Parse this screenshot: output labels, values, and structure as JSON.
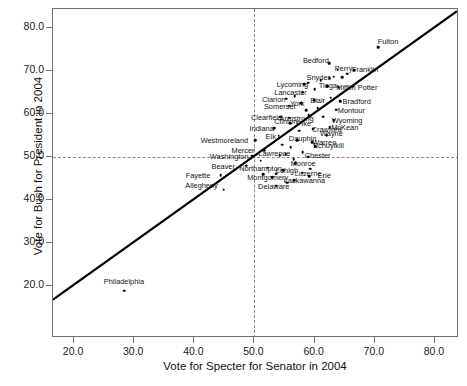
{
  "chart_data": {
    "type": "scatter",
    "title": "",
    "xlabel": "Vote for Specter for Senator in 2004",
    "ylabel": "Vote for Bush for President in 2004",
    "xlim": [
      16.5,
      84.0
    ],
    "ylim": [
      8.0,
      84.5
    ],
    "xticks": [
      "20.0",
      "30.0",
      "40.0",
      "50.0",
      "60.0",
      "70.0",
      "80.0"
    ],
    "xtick_values": [
      20,
      30,
      40,
      50,
      60,
      70,
      80
    ],
    "yticks": [
      "20.0",
      "30.0",
      "40.0",
      "50.0",
      "60.0",
      "70.0",
      "80.0"
    ],
    "ytick_values": [
      20,
      30,
      40,
      50,
      60,
      70,
      80
    ],
    "grid": false,
    "legend": null,
    "reference_lines": [
      {
        "orientation": "horizontal",
        "value": 50.0,
        "style": "dashed"
      },
      {
        "orientation": "vertical",
        "value": 50.0,
        "style": "dashed"
      }
    ],
    "annotations": [
      {
        "text": "45-degree reference line",
        "style": "solid-black-diagonal"
      }
    ],
    "points": [
      {
        "label": "Philadelphia",
        "x": 28.3,
        "y": 19.0,
        "lx": 28.3,
        "ly": 21.2
      },
      {
        "label": "Allegheny",
        "x": 44.9,
        "y": 42.5,
        "lx": 41.2,
        "ly": 43.5
      },
      {
        "label": "Fayette",
        "x": 44.4,
        "y": 45.8,
        "lx": 40.6,
        "ly": 45.8
      },
      {
        "label": "Beaver",
        "x": 48.6,
        "y": 48.1,
        "lx": 44.8,
        "ly": 48.1
      },
      {
        "label": "Washington",
        "x": 49.6,
        "y": 50.3,
        "lx": 45.8,
        "ly": 50.3
      },
      {
        "label": "Westmoreland",
        "x": 50.1,
        "y": 54.0,
        "lx": 45.0,
        "ly": 54.0
      },
      {
        "label": "Mercer",
        "x": 51.6,
        "y": 51.6,
        "lx": 48.1,
        "ly": 51.6
      },
      {
        "label": "Northampton",
        "x": 52.2,
        "y": 47.6,
        "lx": 51.0,
        "ly": 47.6
      },
      {
        "label": "Montgomery",
        "x": 52.9,
        "y": 45.4,
        "lx": 52.2,
        "ly": 45.4
      },
      {
        "label": "Lawrence",
        "x": 54.2,
        "y": 50.5,
        "lx": 53.3,
        "ly": 51.1
      },
      {
        "label": "Delaware",
        "x": 53.6,
        "y": 43.4,
        "lx": 53.2,
        "ly": 43.4
      },
      {
        "label": "Lehigh",
        "x": 54.8,
        "y": 47.0,
        "lx": 55.4,
        "ly": 47.0
      },
      {
        "label": "Lackawanna",
        "x": 56.6,
        "y": 44.7,
        "lx": 58.3,
        "ly": 44.7
      },
      {
        "label": "Monroe",
        "x": 56.8,
        "y": 48.6,
        "lx": 58.1,
        "ly": 48.6
      },
      {
        "label": "Luzerne",
        "x": 57.9,
        "y": 46.4,
        "lx": 58.9,
        "ly": 46.4
      },
      {
        "label": "Erie",
        "x": 59.1,
        "y": 45.6,
        "lx": 61.6,
        "ly": 45.8
      },
      {
        "label": "Chester",
        "x": 58.9,
        "y": 50.2,
        "lx": 60.5,
        "ly": 50.5
      },
      {
        "label": "Schuylkill",
        "x": 60.1,
        "y": 52.6,
        "lx": 62.3,
        "ly": 52.8
      },
      {
        "label": "Dauphin",
        "x": 57.1,
        "y": 54.0,
        "lx": 58.0,
        "ly": 54.6
      },
      {
        "label": "Warren",
        "x": 59.6,
        "y": 53.5,
        "lx": 61.6,
        "ly": 53.5
      },
      {
        "label": "Elk",
        "x": 54.0,
        "y": 55.0,
        "lx": 52.7,
        "ly": 55.0
      },
      {
        "label": "Indiana",
        "x": 53.3,
        "y": 56.8,
        "lx": 51.2,
        "ly": 56.8
      },
      {
        "label": "Clinton",
        "x": 55.9,
        "y": 57.9,
        "lx": 55.2,
        "ly": 58.4
      },
      {
        "label": "Pike",
        "x": 57.5,
        "y": 57.8,
        "lx": 58.2,
        "ly": 58.0
      },
      {
        "label": "Crawford",
        "x": 59.8,
        "y": 56.7,
        "lx": 62.0,
        "ly": 56.7
      },
      {
        "label": "Armstrong",
        "x": 55.8,
        "y": 59.2,
        "lx": 57.0,
        "ly": 59.2
      },
      {
        "label": "Clearfield",
        "x": 54.3,
        "y": 59.5,
        "lx": 52.0,
        "ly": 59.5
      },
      {
        "label": "Wayne",
        "x": 62.0,
        "y": 55.2,
        "lx": 62.8,
        "ly": 55.6
      },
      {
        "label": "McKean",
        "x": 62.5,
        "y": 57.0,
        "lx": 65.0,
        "ly": 57.1
      },
      {
        "label": "Wyoming",
        "x": 63.2,
        "y": 58.6,
        "lx": 65.4,
        "ly": 58.6
      },
      {
        "label": "Somerset",
        "x": 55.8,
        "y": 62.0,
        "lx": 54.2,
        "ly": 62.0
      },
      {
        "label": "York",
        "x": 57.8,
        "y": 62.6,
        "lx": 57.1,
        "ly": 62.6
      },
      {
        "label": "Clarion",
        "x": 55.3,
        "y": 63.6,
        "lx": 53.2,
        "ly": 63.6
      },
      {
        "label": "Blair",
        "x": 59.9,
        "y": 63.3,
        "lx": 60.5,
        "ly": 63.4
      },
      {
        "label": "Montour",
        "x": 63.6,
        "y": 61.1,
        "lx": 66.1,
        "ly": 61.1
      },
      {
        "label": "Bradford",
        "x": 64.2,
        "y": 63.0,
        "lx": 67.0,
        "ly": 63.1
      },
      {
        "label": "Lancaster",
        "x": 58.0,
        "y": 65.2,
        "lx": 56.0,
        "ly": 65.2
      },
      {
        "label": "Lycoming",
        "x": 58.3,
        "y": 67.0,
        "lx": 56.3,
        "ly": 67.0
      },
      {
        "label": "Tioga",
        "x": 62.1,
        "y": 66.5,
        "lx": 62.2,
        "ly": 66.8
      },
      {
        "label": "Mifflin",
        "x": 64.0,
        "y": 66.3,
        "lx": 65.2,
        "ly": 66.4
      },
      {
        "label": "Potter",
        "x": 66.3,
        "y": 66.4,
        "lx": 68.8,
        "ly": 66.4
      },
      {
        "label": "Snyder",
        "x": 62.5,
        "y": 68.4,
        "lx": 60.6,
        "ly": 68.6
      },
      {
        "label": "Perry",
        "x": 63.8,
        "y": 70.4,
        "lx": 64.8,
        "ly": 70.7
      },
      {
        "label": "Bedford",
        "x": 62.4,
        "y": 71.9,
        "lx": 60.2,
        "ly": 72.6
      },
      {
        "label": "Franklin",
        "x": 66.6,
        "y": 70.2,
        "lx": 68.4,
        "ly": 70.6
      },
      {
        "label": "Fulton",
        "x": 70.6,
        "y": 75.6,
        "lx": 72.2,
        "ly": 77.0
      },
      {
        "label": "",
        "x": 56.5,
        "y": 49.6,
        "lx": null,
        "ly": null
      },
      {
        "label": "",
        "x": 55.2,
        "y": 50.8,
        "lx": null,
        "ly": null
      },
      {
        "label": "",
        "x": 51.0,
        "y": 49.2,
        "lx": null,
        "ly": null
      },
      {
        "label": "",
        "x": 56.0,
        "y": 52.3,
        "lx": null,
        "ly": null
      },
      {
        "label": "",
        "x": 58.0,
        "y": 51.2,
        "lx": null,
        "ly": null
      },
      {
        "label": "",
        "x": 54.6,
        "y": 52.9,
        "lx": null,
        "ly": null
      },
      {
        "label": "",
        "x": 57.4,
        "y": 56.2,
        "lx": null,
        "ly": null
      },
      {
        "label": "",
        "x": 59.0,
        "y": 59.8,
        "lx": null,
        "ly": null
      },
      {
        "label": "",
        "x": 61.4,
        "y": 59.5,
        "lx": null,
        "ly": null
      },
      {
        "label": "",
        "x": 60.5,
        "y": 61.5,
        "lx": null,
        "ly": null
      },
      {
        "label": "",
        "x": 58.6,
        "y": 61.0,
        "lx": null,
        "ly": null
      },
      {
        "label": "",
        "x": 56.7,
        "y": 64.2,
        "lx": null,
        "ly": null
      },
      {
        "label": "",
        "x": 58.9,
        "y": 67.4,
        "lx": null,
        "ly": null
      },
      {
        "label": "",
        "x": 61.0,
        "y": 68.0,
        "lx": null,
        "ly": null
      },
      {
        "label": "",
        "x": 63.2,
        "y": 68.8,
        "lx": null,
        "ly": null
      },
      {
        "label": "",
        "x": 64.6,
        "y": 68.7,
        "lx": null,
        "ly": null
      },
      {
        "label": "",
        "x": 65.4,
        "y": 69.5,
        "lx": null,
        "ly": null
      },
      {
        "label": "",
        "x": 53.6,
        "y": 46.2,
        "lx": null,
        "ly": null
      },
      {
        "label": "",
        "x": 51.4,
        "y": 46.1,
        "lx": null,
        "ly": null
      },
      {
        "label": "",
        "x": 55.4,
        "y": 44.1,
        "lx": null,
        "ly": null
      },
      {
        "label": "",
        "x": 59.3,
        "y": 47.4,
        "lx": null,
        "ly": null
      },
      {
        "label": "",
        "x": 62.7,
        "y": 63.9,
        "lx": null,
        "ly": null
      },
      {
        "label": "",
        "x": 60.0,
        "y": 65.8,
        "lx": null,
        "ly": null
      }
    ]
  }
}
